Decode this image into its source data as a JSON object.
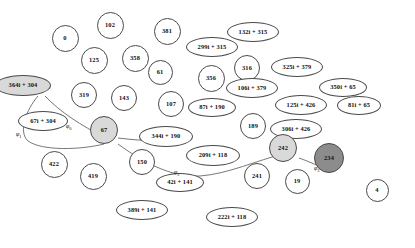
{
  "diagram": {
    "style": {
      "node_stroke": "#4a4a4a",
      "node_fill_default": "#ffffff",
      "node_fill_highlight": "#d9d9d9",
      "node_fill_selected": "#8c8c8c",
      "edge_stroke": "#555555",
      "text_color": "#111111",
      "background": "#ffffff"
    },
    "nodes": [
      {
        "id": "n0",
        "label": "0",
        "shape": "circle",
        "x": 65,
        "y": 38,
        "w": 27,
        "h": 27,
        "fill": "white"
      },
      {
        "id": "n102",
        "label": "102",
        "shape": "circle",
        "x": 110,
        "y": 25,
        "w": 27,
        "h": 27,
        "fill": "white"
      },
      {
        "id": "n381",
        "label": "381",
        "shape": "circle",
        "x": 167,
        "y": 31,
        "w": 27,
        "h": 27,
        "fill": "white"
      },
      {
        "id": "n132",
        "label": "132i + 315",
        "shape": "ellipse",
        "x": 253,
        "y": 32,
        "w": 52,
        "h": 20,
        "fill": "white"
      },
      {
        "id": "n299",
        "label": "299i + 315",
        "shape": "ellipse",
        "x": 212,
        "y": 47,
        "w": 52,
        "h": 20,
        "fill": "white"
      },
      {
        "id": "n125c",
        "label": "125",
        "shape": "circle",
        "x": 94,
        "y": 60,
        "w": 27,
        "h": 27,
        "fill": "white"
      },
      {
        "id": "n358",
        "label": "358",
        "shape": "circle",
        "x": 135,
        "y": 58,
        "w": 27,
        "h": 27,
        "fill": "white"
      },
      {
        "id": "n61",
        "label": "61",
        "shape": "circle",
        "x": 160,
        "y": 72,
        "w": 25,
        "h": 25,
        "fill": "white"
      },
      {
        "id": "n316",
        "label": "316",
        "shape": "circle",
        "x": 247,
        "y": 68,
        "w": 26,
        "h": 26,
        "fill": "white"
      },
      {
        "id": "n325",
        "label": "325i + 379",
        "shape": "ellipse",
        "x": 297,
        "y": 67,
        "w": 52,
        "h": 20,
        "fill": "white"
      },
      {
        "id": "n356",
        "label": "356",
        "shape": "circle",
        "x": 211,
        "y": 78,
        "w": 27,
        "h": 27,
        "fill": "white"
      },
      {
        "id": "n350",
        "label": "350i + 65",
        "shape": "ellipse",
        "x": 343,
        "y": 87,
        "w": 48,
        "h": 19,
        "fill": "white"
      },
      {
        "id": "n364",
        "label": "364i + 304",
        "shape": "ellipse",
        "x": 23,
        "y": 85,
        "w": 56,
        "h": 21,
        "fill": "#d9d9d9"
      },
      {
        "id": "n319",
        "label": "319",
        "shape": "circle",
        "x": 84,
        "y": 95,
        "w": 26,
        "h": 26,
        "fill": "white"
      },
      {
        "id": "n143",
        "label": "143",
        "shape": "circle",
        "x": 124,
        "y": 98,
        "w": 26,
        "h": 26,
        "fill": "white"
      },
      {
        "id": "n107",
        "label": "107",
        "shape": "circle",
        "x": 171,
        "y": 104,
        "w": 26,
        "h": 26,
        "fill": "white"
      },
      {
        "id": "n106",
        "label": "106i + 379",
        "shape": "ellipse",
        "x": 252,
        "y": 88,
        "w": 52,
        "h": 20,
        "fill": "white"
      },
      {
        "id": "n125b",
        "label": "125i + 426",
        "shape": "ellipse",
        "x": 301,
        "y": 105,
        "w": 52,
        "h": 20,
        "fill": "white"
      },
      {
        "id": "n81",
        "label": "81i + 65",
        "shape": "ellipse",
        "x": 359,
        "y": 105,
        "w": 44,
        "h": 19,
        "fill": "white"
      },
      {
        "id": "n87",
        "label": "87i + 190",
        "shape": "ellipse",
        "x": 212,
        "y": 107,
        "w": 48,
        "h": 19,
        "fill": "white"
      },
      {
        "id": "n67e",
        "label": "67i + 304",
        "shape": "ellipse",
        "x": 43,
        "y": 121,
        "w": 50,
        "h": 20,
        "fill": "white"
      },
      {
        "id": "n306",
        "label": "306i + 426",
        "shape": "ellipse",
        "x": 296,
        "y": 129,
        "w": 52,
        "h": 20,
        "fill": "white"
      },
      {
        "id": "n189",
        "label": "189",
        "shape": "circle",
        "x": 253,
        "y": 126,
        "w": 26,
        "h": 26,
        "fill": "white"
      },
      {
        "id": "n344",
        "label": "344i + 190",
        "shape": "ellipse",
        "x": 166,
        "y": 136,
        "w": 54,
        "h": 21,
        "fill": "white"
      },
      {
        "id": "n67",
        "label": "67",
        "shape": "circle",
        "x": 104,
        "y": 130,
        "w": 28,
        "h": 28,
        "fill": "#d9d9d9"
      },
      {
        "id": "n209",
        "label": "209i + 118",
        "shape": "ellipse",
        "x": 213,
        "y": 155,
        "w": 54,
        "h": 21,
        "fill": "white"
      },
      {
        "id": "n242",
        "label": "242",
        "shape": "circle",
        "x": 283,
        "y": 148,
        "w": 28,
        "h": 28,
        "fill": "#d9d9d9"
      },
      {
        "id": "n234",
        "label": "234",
        "shape": "circle",
        "x": 329,
        "y": 158,
        "w": 30,
        "h": 30,
        "fill": "#8c8c8c"
      },
      {
        "id": "n422",
        "label": "422",
        "shape": "circle",
        "x": 54,
        "y": 164,
        "w": 27,
        "h": 27,
        "fill": "white"
      },
      {
        "id": "n150",
        "label": "150",
        "shape": "circle",
        "x": 142,
        "y": 162,
        "w": 26,
        "h": 26,
        "fill": "white"
      },
      {
        "id": "n419",
        "label": "419",
        "shape": "circle",
        "x": 93,
        "y": 176,
        "w": 27,
        "h": 27,
        "fill": "white"
      },
      {
        "id": "n241",
        "label": "241",
        "shape": "circle",
        "x": 257,
        "y": 176,
        "w": 26,
        "h": 26,
        "fill": "white"
      },
      {
        "id": "n19",
        "label": "19",
        "shape": "circle",
        "x": 297,
        "y": 181,
        "w": 25,
        "h": 25,
        "fill": "white"
      },
      {
        "id": "n4",
        "label": "4",
        "shape": "circle",
        "x": 377,
        "y": 190,
        "w": 23,
        "h": 23,
        "fill": "white"
      },
      {
        "id": "n42",
        "label": "42i + 141",
        "shape": "ellipse",
        "x": 180,
        "y": 182,
        "w": 48,
        "h": 19,
        "fill": "white"
      },
      {
        "id": "n389",
        "label": "389i + 141",
        "shape": "ellipse",
        "x": 142,
        "y": 210,
        "w": 52,
        "h": 20,
        "fill": "white"
      },
      {
        "id": "n222",
        "label": "222i + 118",
        "shape": "ellipse",
        "x": 232,
        "y": 217,
        "w": 52,
        "h": 20,
        "fill": "white"
      }
    ],
    "edge_labels": [
      {
        "id": "phi0",
        "base": "φ",
        "sub": "0",
        "x": 66,
        "y": 123
      },
      {
        "id": "phi1",
        "base": "φ",
        "sub": "1",
        "x": 16,
        "y": 131
      },
      {
        "id": "phi2",
        "base": "φ",
        "sub": "2",
        "x": 174,
        "y": 169
      },
      {
        "id": "phi3",
        "base": "φ",
        "sub": "3",
        "x": 314,
        "y": 165
      }
    ],
    "edges": [
      {
        "from": "364i + 304",
        "to": "67",
        "label": "φ₀"
      },
      {
        "from": "364i + 304",
        "to": "67",
        "label": "φ₁"
      },
      {
        "from": "67",
        "to": "242",
        "label": "φ₂"
      },
      {
        "from": "242",
        "to": "234",
        "label": "φ₃"
      }
    ]
  }
}
